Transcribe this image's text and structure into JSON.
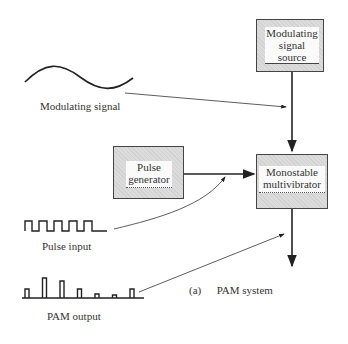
{
  "diagram": {
    "blocks": {
      "modulating_source": {
        "line1": "Modulating",
        "line2": "signal",
        "line3": "source"
      },
      "monostable": {
        "line1": "Monostable",
        "line2": "multivibrator"
      },
      "pulse_generator": {
        "line1": "Pulse",
        "line2": "generator"
      }
    },
    "labels": {
      "modulating_signal": "Modulating signal",
      "pulse_input": "Pulse input",
      "pam_output": "PAM output",
      "caption_tag": "(a)",
      "caption": "PAM system"
    },
    "pam_pulse_relative_heights": [
      0.45,
      1.0,
      0.85,
      0.45,
      0.2,
      0.15,
      0.45
    ]
  }
}
